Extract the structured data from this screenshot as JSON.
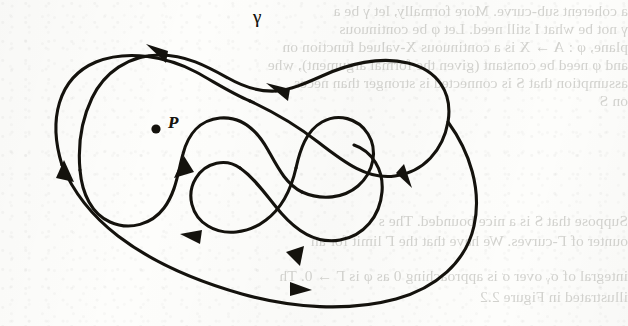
{
  "page": {
    "width": 628,
    "height": 326,
    "background_color": "#fdfdfb",
    "ink_color": "#14120d",
    "bleed_text_color": "#b9b9b4"
  },
  "figure": {
    "name": "oriented-closed-curve-diagram",
    "curve_label": "γ",
    "point_label": "P",
    "arrowhead_count": 6,
    "marked_points": [
      {
        "label": "P",
        "x": 156,
        "y": 129
      }
    ]
  },
  "bleed_text": {
    "note": "Faint text bleeding through from the reverse side of the scanned page",
    "lines": [
      {
        "text": "a coherent sub-curve. More formally, let γ be a",
        "x": 0,
        "y": 4
      },
      {
        "text": "γ not be what I still need. Let φ be continuous",
        "x": 0,
        "y": 22
      },
      {
        "text": "plane, φ : A → X is a continuous X-valued function on",
        "x": 0,
        "y": 40
      },
      {
        "text": "and φ need be constant (given the formal argument), whe",
        "x": 0,
        "y": 58
      },
      {
        "text": "assumption that S is connected is stronger than neces",
        "x": 0,
        "y": 76
      },
      {
        "text": "on S",
        "x": 0,
        "y": 94
      },
      {
        "text": "Suppose that S is a nice bounded. The s",
        "x": 0,
        "y": 214
      },
      {
        "text": "ounter of Γ-curves. We have that the Γ limit for an",
        "x": 0,
        "y": 234
      },
      {
        "text": "integral of σᵧ over σ is approaching 0 as φ is Γ → 0. Th",
        "x": 0,
        "y": 269
      },
      {
        "text": "illustrated in Figure 2.2",
        "x": 0,
        "y": 290
      }
    ]
  },
  "labels": {
    "gamma": {
      "text": "γ",
      "x": 253,
      "y": 8
    },
    "p": {
      "text": "P",
      "x": 170,
      "y": 114
    }
  }
}
